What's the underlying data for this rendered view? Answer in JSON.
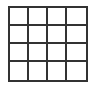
{
  "grid": {
    "rows": 4,
    "columns": 4,
    "line_color": "#333333",
    "cell_color": "#ffffff",
    "cells": [
      [
        "",
        "",
        "",
        ""
      ],
      [
        "",
        "",
        "",
        ""
      ],
      [
        "",
        "",
        "",
        ""
      ],
      [
        "",
        "",
        "",
        ""
      ]
    ]
  }
}
